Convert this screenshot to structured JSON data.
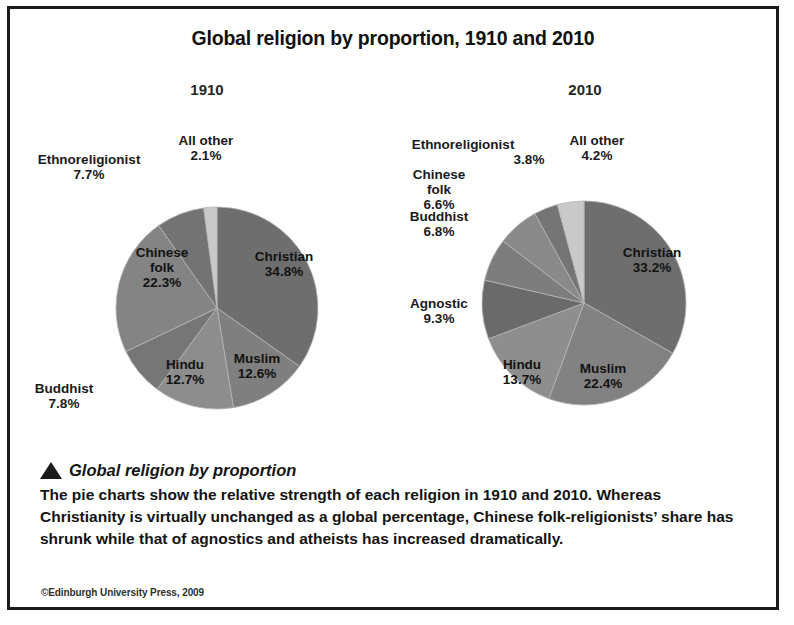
{
  "figure": {
    "title": "Global religion by proportion, 1910 and 2010",
    "copyright": "©Edinburgh University Press, 2009"
  },
  "caption": {
    "bullet_icon": "triangle-bullet-icon",
    "title": "Global religion by proportion",
    "body": "The pie charts show the relative strength of each religion in 1910 and 2010. Whereas Christianity is virtually unchanged as a global percentage, Chinese folk-religionists’ share has shrunk while that of agnostics and atheists has increased dramatically."
  },
  "chart_data": [
    {
      "type": "pie",
      "title": "1910",
      "start_angle": 0,
      "direction": "clockwise",
      "labels": [
        "Christian",
        "Muslim",
        "Hindu",
        "Buddhist",
        "Chinese folk",
        "Ethnoreligionist",
        "All other"
      ],
      "values": [
        34.8,
        12.6,
        12.7,
        7.8,
        22.3,
        7.7,
        2.1
      ],
      "value_labels": [
        "34.8%",
        "12.6%",
        "12.7%",
        "7.8%",
        "22.3%",
        "7.7%",
        "2.1%"
      ],
      "colors": [
        "#6e6e6e",
        "#7f7f7f",
        "#8d8d8d",
        "#767676",
        "#848484",
        "#737373",
        "#c9c9c9"
      ]
    },
    {
      "type": "pie",
      "title": "2010",
      "start_angle": 0,
      "direction": "clockwise",
      "labels": [
        "Christian",
        "Muslim",
        "Hindu",
        "Agnostic",
        "Buddhist",
        "Chinese folk",
        "Ethnoreligionist",
        "All other"
      ],
      "values": [
        33.2,
        22.4,
        13.7,
        9.3,
        6.8,
        6.6,
        3.8,
        4.2
      ],
      "value_labels": [
        "33.2%",
        "22.4%",
        "13.7%",
        "9.3%",
        "6.8%",
        "6.6%",
        "3.8%",
        "4.2%"
      ],
      "colors": [
        "#6e6e6e",
        "#828282",
        "#8e8e8e",
        "#6a6a6a",
        "#7d7d7d",
        "#8a8a8a",
        "#757575",
        "#c9c9c9"
      ]
    }
  ],
  "chart_1910": {
    "year": "1910",
    "christian_name": "Christian",
    "christian_pct": "34.8%",
    "muslim_name": "Muslim",
    "muslim_pct": "12.6%",
    "hindu_name": "Hindu",
    "hindu_pct": "12.7%",
    "buddhist_name": "Buddhist",
    "buddhist_pct": "7.8%",
    "chinese_name": "Chinese",
    "chinese_name2": "folk",
    "chinese_pct": "22.3%",
    "ethno_name": "Ethnoreligionist",
    "ethno_pct": "7.7%",
    "allother_name": "All other",
    "allother_pct": "2.1%"
  },
  "chart_2010": {
    "year": "2010",
    "christian_name": "Christian",
    "christian_pct": "33.2%",
    "muslim_name": "Muslim",
    "muslim_pct": "22.4%",
    "hindu_name": "Hindu",
    "hindu_pct": "13.7%",
    "agnostic_name": "Agnostic",
    "agnostic_pct": "9.3%",
    "buddhist_name": "Buddhist",
    "buddhist_pct": "6.8%",
    "chinese_name": "Chinese",
    "chinese_name2": "folk",
    "chinese_pct": "6.6%",
    "ethno_name": "Ethnoreligionist",
    "ethno_pct": "3.8%",
    "allother_name": "All other",
    "allother_pct": "4.2%"
  }
}
